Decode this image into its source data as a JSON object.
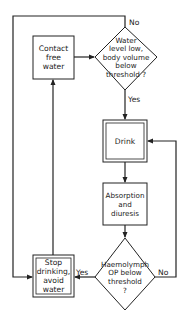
{
  "diagram": {
    "type": "flowchart",
    "nodes": {
      "contact": {
        "shape": "rect",
        "lines": [
          "Contact",
          "free",
          "water"
        ]
      },
      "decision1": {
        "shape": "diamond",
        "lines": [
          "Water",
          "level low,",
          "body volume",
          "below",
          "threshold ?"
        ]
      },
      "drink": {
        "shape": "double-rect",
        "lines": [
          "Drink"
        ]
      },
      "absorption": {
        "shape": "rect",
        "lines": [
          "Absorption",
          "and",
          "diuresis"
        ]
      },
      "decision2": {
        "shape": "diamond",
        "lines": [
          "Haemolymph",
          "OP below",
          "threshold",
          "?"
        ]
      },
      "stop": {
        "shape": "double-rect",
        "lines": [
          "Stop",
          "drinking,",
          "avoid",
          "water"
        ]
      }
    },
    "edges": [
      {
        "from": "contact",
        "to": "decision1",
        "label": ""
      },
      {
        "from": "decision1",
        "to": "drink",
        "label": "Yes"
      },
      {
        "from": "decision1",
        "to": "stop",
        "label": "No"
      },
      {
        "from": "drink",
        "to": "absorption",
        "label": ""
      },
      {
        "from": "absorption",
        "to": "decision2",
        "label": ""
      },
      {
        "from": "decision2",
        "to": "stop",
        "label": "Yes"
      },
      {
        "from": "decision2",
        "to": "drink",
        "label": "No"
      },
      {
        "from": "stop",
        "to": "contact",
        "label": ""
      }
    ],
    "edge_labels": {
      "d1_no": "No",
      "d1_yes": "Yes",
      "d2_yes": "Yes",
      "d2_no": "No"
    },
    "line_color": "#222222"
  }
}
